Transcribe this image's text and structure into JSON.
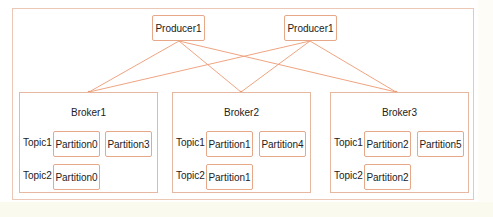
{
  "diagram": {
    "colors": {
      "edge": "#ec9a73",
      "box_border": "#e7a789",
      "frame_border": "#ecc7b5"
    },
    "producers": [
      {
        "label": "Producer1"
      },
      {
        "label": "Producer1"
      }
    ],
    "brokers": [
      {
        "label": "Broker1",
        "topics": [
          {
            "label": "Topic1",
            "partitions": [
              "Partition0",
              "Partition3"
            ]
          },
          {
            "label": "Topic2",
            "partitions": [
              "Partition0"
            ]
          }
        ]
      },
      {
        "label": "Broker2",
        "topics": [
          {
            "label": "Topic1",
            "partitions": [
              "Partition1",
              "Partition4"
            ]
          },
          {
            "label": "Topic2",
            "partitions": [
              "Partition1"
            ]
          }
        ]
      },
      {
        "label": "Broker3",
        "topics": [
          {
            "label": "Topic1",
            "partitions": [
              "Partition2",
              "Partition5"
            ]
          },
          {
            "label": "Topic2",
            "partitions": [
              "Partition2"
            ]
          }
        ]
      }
    ],
    "edges": [
      {
        "from": "producer-0",
        "to": "broker-0"
      },
      {
        "from": "producer-0",
        "to": "broker-1"
      },
      {
        "from": "producer-0",
        "to": "broker-2"
      },
      {
        "from": "producer-1",
        "to": "broker-0"
      },
      {
        "from": "producer-1",
        "to": "broker-1"
      },
      {
        "from": "producer-1",
        "to": "broker-2"
      }
    ]
  }
}
